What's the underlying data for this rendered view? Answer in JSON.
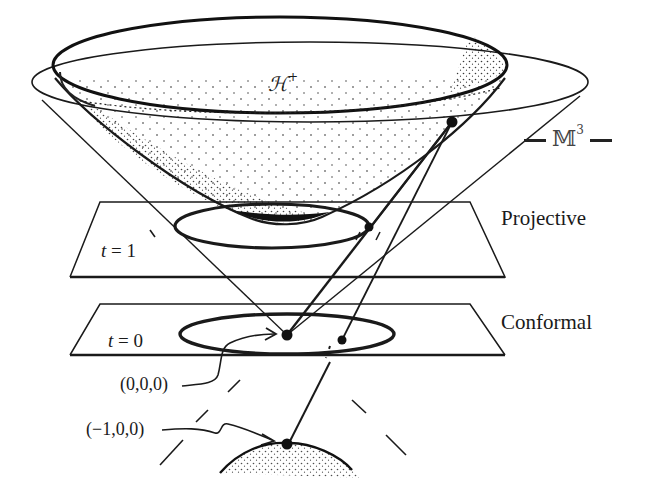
{
  "figure": {
    "type": "hyperboloid-model-diagram",
    "labels": {
      "hyperboloid": "ℋ",
      "hyperboloid_sup": "+",
      "space_name": "𝕄",
      "space_sup": "3",
      "projective_plane": "Projective",
      "conformal_plane": "Conformal",
      "t1_var": "t",
      "t1_eq": " = 1",
      "t0_var": "t",
      "t0_eq": " = 0",
      "origin": "(0,0,0)",
      "south_pole": "(−1,0,0)"
    },
    "colors": {
      "ink": "#1a1a1a",
      "background": "#ffffff",
      "stipple": "#222222"
    },
    "elements": [
      "light-cone",
      "upper-hyperboloid-sheet",
      "projective-plane-t1",
      "conformal-plane-t0",
      "lower-hyperboloid-sheet",
      "projection-lines",
      "projection-points"
    ]
  }
}
